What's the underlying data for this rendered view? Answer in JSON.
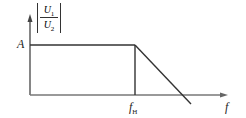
{
  "diagram": {
    "type": "frequency-response",
    "y_label": {
      "numerator": "U",
      "numerator_sub": "1",
      "denominator": "U",
      "denominator_sub": "2"
    },
    "level_label": "A",
    "cutoff_label": "f",
    "cutoff_sub": "H",
    "x_label": "f",
    "colors": {
      "line": "#333333",
      "background": "#ffffff"
    }
  }
}
